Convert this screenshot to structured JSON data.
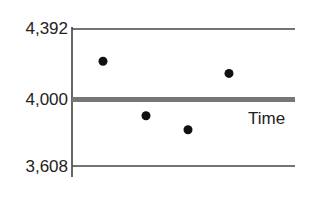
{
  "chart_data": {
    "type": "scatter",
    "title": "",
    "xlabel": "Time",
    "ylabel": "",
    "ylim": [
      3608,
      4392
    ],
    "y_ticks": [
      "4,392",
      "4,000",
      "3,608"
    ],
    "y_tick_values": [
      4392,
      4000,
      3608
    ],
    "center_line": 4000,
    "upper_limit": 4392,
    "lower_limit": 3608,
    "grid": false,
    "legend": null,
    "series": [
      {
        "name": "Observations",
        "x": [
          1,
          2,
          3,
          4
        ],
        "values": [
          4207,
          3896,
          3816,
          4138
        ]
      }
    ]
  },
  "labels": {
    "y_top": "4,392",
    "y_mid": "4,000",
    "y_bot": "3,608",
    "x_axis": "Time"
  },
  "colors": {
    "axis": "#333333",
    "center_line": "#777777",
    "points": "#111111"
  }
}
